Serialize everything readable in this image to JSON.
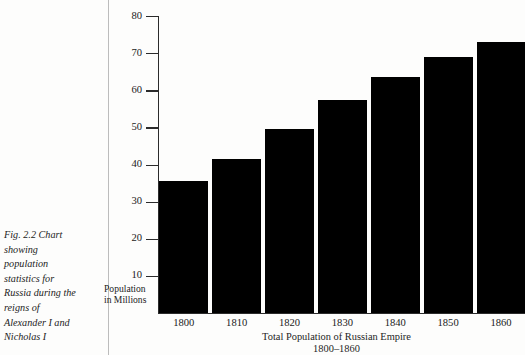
{
  "figure_caption": {
    "lines": [
      "Fig. 2.2 Chart",
      "showing",
      "population",
      "statistics for",
      "Russia during the",
      "reigns of",
      "Alexander I and",
      "Nicholas I"
    ]
  },
  "axis": {
    "y_label_line1": "Population",
    "y_label_line2": "in Millions",
    "y_ticks": [
      "80",
      "70",
      "60",
      "50",
      "40",
      "30",
      "20",
      "10"
    ]
  },
  "title": {
    "line1": "Total Population of Russian Empire",
    "line2": "1800–1860"
  },
  "colors": {
    "bar": "#000000",
    "axis": "#2b2b2b",
    "divider": "#bcbcbc",
    "background": "#fdfdfc",
    "text": "#1e1e1e"
  },
  "chart_data": {
    "type": "bar",
    "title": "Total Population of Russian Empire 1800–1860",
    "subtitle": "1800–1860",
    "xlabel": "Total Population of Russian Empire",
    "ylabel": "Population in Millions",
    "categories": [
      "1800",
      "1810",
      "1820",
      "1830",
      "1840",
      "1850",
      "1860"
    ],
    "values": [
      35.5,
      41.5,
      49.5,
      57.5,
      63.5,
      69.0,
      73.0
    ],
    "ylim": [
      0,
      80
    ],
    "ytick_values": [
      10,
      20,
      30,
      40,
      50,
      60,
      70,
      80
    ],
    "grid": false,
    "legend": false,
    "series": [
      {
        "name": "Population of Russian Empire (millions)",
        "values": [
          35.5,
          41.5,
          49.5,
          57.5,
          63.5,
          69.0,
          73.0
        ]
      }
    ]
  }
}
